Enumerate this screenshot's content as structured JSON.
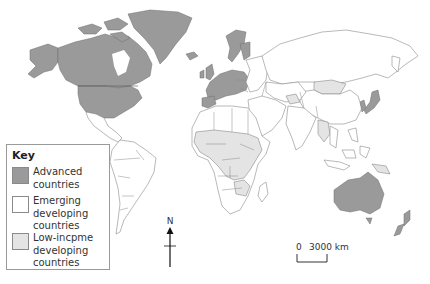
{
  "map": {
    "title": "World map of countries by development status",
    "projection": "world",
    "colors": {
      "advanced": "#9a9a9a",
      "emerging": "#ffffff",
      "low_income": "#e4e4e4",
      "border": "#8a8a8a",
      "background": "#ffffff"
    },
    "regions": {
      "advanced": [
        "Canada",
        "United States",
        "Greenland",
        "Western Europe",
        "Scandinavia",
        "Japan",
        "South Korea",
        "Australia",
        "New Zealand"
      ],
      "low_income": [
        "Sub-Saharan Africa (most)",
        "Mongolia",
        "Bolivia",
        "Central Asia (parts)",
        "South-East Asia (parts)",
        "Papua New Guinea"
      ],
      "emerging": [
        "Russia",
        "China",
        "India",
        "Brazil",
        "Mexico",
        "Middle East",
        "South America (most)",
        "North Africa",
        "Southern Africa"
      ]
    }
  },
  "key": {
    "title": "Key",
    "items": [
      {
        "label": "Advanced countries",
        "swatch": "advanced"
      },
      {
        "label": "Emerging developing countries",
        "swatch": "emerging"
      },
      {
        "label": "Low-incpme developing countries",
        "swatch": "low_income"
      }
    ]
  },
  "north_arrow": {
    "label": "N"
  },
  "scale_bar": {
    "start": "0",
    "end": "3000 km"
  }
}
